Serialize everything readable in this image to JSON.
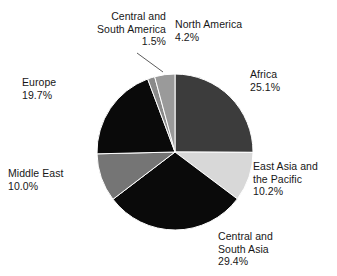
{
  "chart_data": {
    "type": "pie",
    "title": "",
    "subtitle": "",
    "xlabel": "",
    "ylabel": "",
    "legend_position": "none",
    "grid": false,
    "start_angle_deg": 0,
    "direction": "clockwise",
    "categories": [
      "Africa",
      "East Asia and the Pacific",
      "Central and South Asia",
      "Middle East",
      "Europe",
      "Central and South America",
      "North America"
    ],
    "values": [
      25.1,
      10.2,
      29.4,
      10.0,
      19.7,
      1.5,
      4.2
    ],
    "value_unit": "%",
    "slice_colors": [
      "#3c3c3c",
      "#d8d8d8",
      "#0a0a0a",
      "#757575",
      "#0a0a0a",
      "#8a8a8a",
      "#9a9a9a"
    ],
    "slices": [
      {
        "name": "Africa",
        "value": 25.1,
        "label": "Africa",
        "value_label": "25.1%",
        "color": "#3c3c3c"
      },
      {
        "name": "East Asia and the Pacific",
        "value": 10.2,
        "label": "East Asia and the Pacific",
        "value_label": "10.2%",
        "color": "#d8d8d8"
      },
      {
        "name": "Central and South Asia",
        "value": 29.4,
        "label": "Central and South Asia",
        "value_label": "29.4%",
        "color": "#0a0a0a"
      },
      {
        "name": "Middle East",
        "value": 10.0,
        "label": "Middle East",
        "value_label": "10.0%",
        "color": "#757575"
      },
      {
        "name": "Europe",
        "value": 19.7,
        "label": "Europe",
        "value_label": "19.7%",
        "color": "#0a0a0a"
      },
      {
        "name": "Central and South America",
        "value": 1.5,
        "label": "Central and South America",
        "value_label": "1.5%",
        "color": "#8a8a8a"
      },
      {
        "name": "North America",
        "value": 4.2,
        "label": "North America",
        "value_label": "4.2%",
        "color": "#9a9a9a"
      }
    ]
  },
  "labels": {
    "central_south_america": "Central and\nSouth America\n1.5%",
    "north_america": "North America\n4.2%",
    "africa": "Africa\n25.1%",
    "east_asia_pacific": "East Asia and\nthe Pacific\n10.2%",
    "central_south_asia": "Central and\nSouth Asia\n29.4%",
    "middle_east": "Middle East\n10.0%",
    "europe": "Europe\n19.7%"
  },
  "colors": {
    "background": "#ffffff",
    "text": "#171717",
    "slice_outline": "#ffffff",
    "leader_line": "#4a4a4a"
  }
}
